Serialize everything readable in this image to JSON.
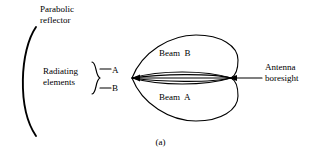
{
  "figure": {
    "caption": "(a)",
    "background_color": "#ffffff",
    "stroke_color": "#000000",
    "width": 321,
    "height": 163
  },
  "labels": {
    "parabolic_reflector": "Parabolic\nreflector",
    "radiating_elements": "Radiating\nelements",
    "element_a": "A",
    "element_b": "B",
    "beam_b": "Beam  B",
    "beam_a": "Beam  A",
    "antenna_boresight": "Antenna\nboresight"
  },
  "diagram": {
    "type": "schematic",
    "elements": [
      {
        "name": "parabolic-reflector-arc",
        "shape": "arc",
        "opens": "right"
      },
      {
        "name": "feed-brace",
        "shape": "brace",
        "orientation": "right"
      },
      {
        "name": "feed-line-a",
        "shape": "line",
        "to": "A"
      },
      {
        "name": "feed-line-b",
        "shape": "line",
        "to": "B"
      },
      {
        "name": "beam-b-lobe",
        "shape": "lobe",
        "position": "upper"
      },
      {
        "name": "beam-a-lobe",
        "shape": "lobe",
        "position": "lower"
      },
      {
        "name": "boresight-lens",
        "shape": "lens",
        "position": "center"
      },
      {
        "name": "boresight-axis-line",
        "shape": "line",
        "orientation": "horizontal"
      },
      {
        "name": "boresight-arrow",
        "shape": "arrow",
        "points": "left"
      }
    ],
    "apex_left": {
      "x": 132,
      "y": 78
    },
    "apex_right": {
      "x": 231,
      "y": 78
    }
  }
}
